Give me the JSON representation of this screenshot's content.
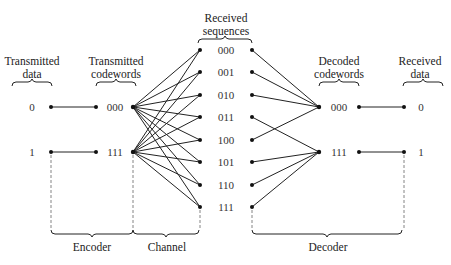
{
  "headers": {
    "transmitted_data": [
      "Transmitted",
      "data"
    ],
    "transmitted_codewords": [
      "Transmitted",
      "codewords"
    ],
    "received_sequences": [
      "Received",
      "sequences"
    ],
    "decoded_codewords": [
      "Decoded",
      "codewords"
    ],
    "received_data": [
      "Received",
      "data"
    ]
  },
  "transmitted_data": [
    "0",
    "1"
  ],
  "transmitted_codewords": [
    "000",
    "111"
  ],
  "received_sequences": [
    "000",
    "001",
    "010",
    "011",
    "100",
    "101",
    "110",
    "111"
  ],
  "decoded_codewords": [
    "000",
    "111"
  ],
  "received_data": [
    "0",
    "1"
  ],
  "sections": {
    "encoder": "Encoder",
    "channel": "Channel",
    "decoder": "Decoder"
  },
  "decoding_map": {
    "000": "000",
    "001": "000",
    "010": "000",
    "100": "000",
    "011": "111",
    "101": "111",
    "110": "111",
    "111": "111"
  }
}
